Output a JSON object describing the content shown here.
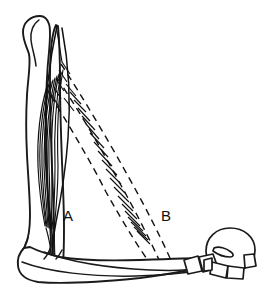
{
  "figure": {
    "width": 267,
    "height": 293,
    "background_color": "#ffffff",
    "ink_color": "#111111"
  },
  "labels": [
    {
      "id": "label-a",
      "text": "A",
      "x": 63,
      "y": 221,
      "refers_to": "parallel-fibered-muscle",
      "line_style": "solid"
    },
    {
      "id": "label-b",
      "text": "B",
      "x": 161,
      "y": 221,
      "refers_to": "pennate-muscle",
      "line_style": "dashed"
    }
  ],
  "structures": {
    "proximal_bone": {
      "name": "tibia-fibula-shaft",
      "style": "solid-outline"
    },
    "distal_bone": {
      "name": "metatarsal-shaft",
      "style": "solid-outline"
    },
    "digit": {
      "name": "toe-phalanges",
      "segment_count": 5,
      "style": "solid-outline"
    },
    "claw": {
      "name": "ungual-claw",
      "style": "solid-outline"
    },
    "muscle_a": {
      "name": "parallel-fibered-muscle",
      "label": "A",
      "line_style": "solid",
      "fiber_count": 9
    },
    "muscle_b": {
      "name": "pennate-muscle",
      "label": "B",
      "line_style": "dashed",
      "fiber_count": 26
    }
  }
}
